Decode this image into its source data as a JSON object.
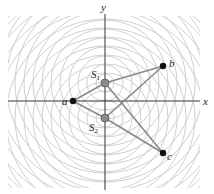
{
  "diagram": {
    "type": "two-source interference",
    "axes": {
      "x_label": "x",
      "y_label": "y"
    },
    "sources": [
      {
        "id": "S1",
        "label": "S",
        "sub": "1"
      },
      {
        "id": "S2",
        "label": "S",
        "sub": "2"
      }
    ],
    "points": [
      {
        "id": "a",
        "label": "a"
      },
      {
        "id": "b",
        "label": "b"
      },
      {
        "id": "c",
        "label": "c"
      }
    ],
    "colors": {
      "wavefront": "#cfcfcf",
      "axis": "#333333",
      "path_line": "#8a8a8a",
      "source_fill": "#8c8c8c",
      "point_fill": "#111111"
    }
  }
}
